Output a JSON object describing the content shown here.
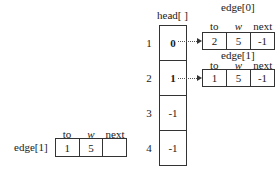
{
  "head": {
    "title": "head[ ]",
    "indices": [
      "1",
      "2",
      "3",
      "4"
    ],
    "cells": [
      "0",
      "1",
      "-1",
      "-1"
    ]
  },
  "edge0": {
    "title": "edge[0]",
    "headers": [
      "to",
      "w",
      "next"
    ],
    "values": [
      "2",
      "5",
      "-1"
    ]
  },
  "edge1": {
    "title": "edge[1]",
    "headers": [
      "to",
      "w",
      "next"
    ],
    "values": [
      "1",
      "5",
      "-1"
    ]
  },
  "edge1_partial": {
    "title": "edge[1]",
    "headers": [
      "to",
      "w",
      "next"
    ],
    "values": [
      "1",
      "5",
      ""
    ]
  }
}
